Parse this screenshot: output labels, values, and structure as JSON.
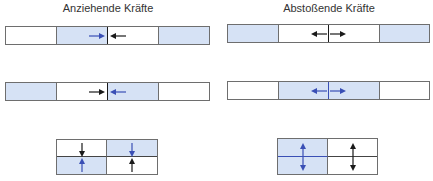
{
  "titles": {
    "attractive": "Anziehende Kräfte",
    "repulsive": "Abstoßende Kräfte"
  },
  "colors": {
    "fill_blue": "#d6e2f5",
    "arrow_blue": "#3a4fb5",
    "arrow_black": "#1a1a1a",
    "border": "#6e6e6e"
  },
  "panels": {
    "attractive": {
      "row1": {
        "cells": [
          "white",
          "blue",
          "white",
          "blue"
        ],
        "arrows": [
          {
            "cell": 1,
            "dir": "right",
            "color": "blue"
          },
          {
            "cell": 2,
            "dir": "left",
            "color": "black"
          }
        ]
      },
      "row2": {
        "cells": [
          "blue",
          "white",
          "blue",
          "white"
        ],
        "arrows": [
          {
            "cell": 1,
            "dir": "right",
            "color": "black"
          },
          {
            "cell": 2,
            "dir": "left",
            "color": "blue"
          }
        ]
      },
      "grid": {
        "cells": [
          [
            "white",
            "blue"
          ],
          [
            "blue",
            "white"
          ]
        ],
        "arrows": [
          "down-black",
          "down-blue",
          "up-blue",
          "up-black"
        ]
      }
    },
    "repulsive": {
      "row1": {
        "cells": [
          "blue",
          "white",
          "white",
          "blue"
        ],
        "arrows": [
          {
            "cell": 1,
            "dir": "left",
            "color": "black"
          },
          {
            "cell": 2,
            "dir": "right",
            "color": "black"
          }
        ]
      },
      "row2": {
        "cells": [
          "white",
          "blue",
          "blue",
          "white"
        ],
        "arrows": [
          {
            "cell": 1,
            "dir": "left",
            "color": "blue"
          },
          {
            "cell": 2,
            "dir": "right",
            "color": "blue"
          }
        ]
      },
      "grid": {
        "cells": [
          [
            "blue",
            "white"
          ],
          [
            "blue",
            "white"
          ]
        ],
        "arrows": [
          "up-blue",
          "up-black",
          "down-blue",
          "down-black"
        ]
      }
    }
  }
}
